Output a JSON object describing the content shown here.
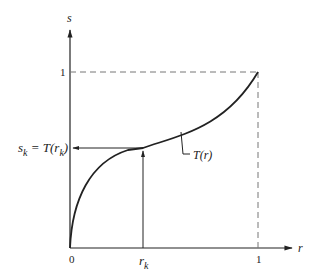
{
  "diagram": {
    "axes": {
      "x_label": "r",
      "y_label": "s",
      "x_ticks": [
        "0",
        "r_k",
        "1"
      ],
      "y_ticks": [
        "1",
        "s_k = T(r_k)"
      ]
    },
    "labels": {
      "y_axis": "s",
      "x_axis": "r",
      "origin": "0",
      "x_one": "1",
      "y_one": "1",
      "rk_main": "r",
      "rk_sub": "k",
      "sk_main": "s",
      "sk_sub": "k",
      "sk_eq": " = T(r",
      "sk_sub2": "k",
      "sk_close": ")",
      "curve": "T(r)"
    },
    "colors": {
      "ink": "#222222",
      "dashed": "#777777",
      "background": "#ffffff"
    }
  }
}
